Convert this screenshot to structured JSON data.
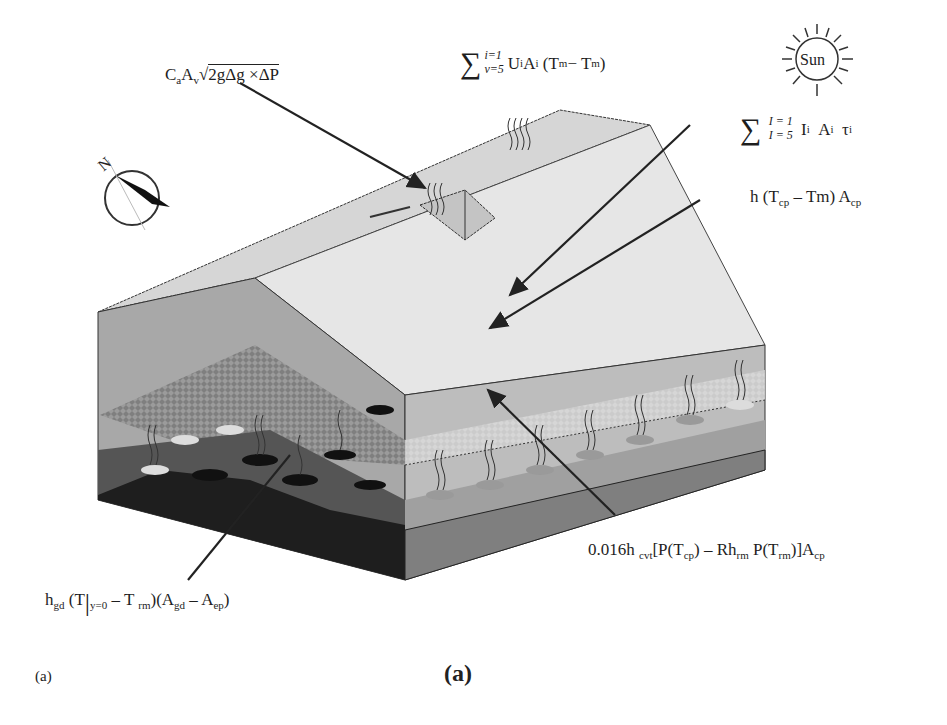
{
  "figure": {
    "caption_small": "(a)",
    "caption_large": "(a)",
    "compass_label": "N",
    "sun_label": "Sun"
  },
  "equations": {
    "ventilation": {
      "text": "C_a A_v √(2gΔg × ΔP)",
      "parts": {
        "c": "C",
        "c_sub": "a",
        "a": "A",
        "a_sub": "v",
        "radical": "2gΔg ×ΔP"
      }
    },
    "conduction_cover": {
      "text": "Σ_{v=5}^{i=1} U_i A_i (T_m − T_m)",
      "upper": "i=1",
      "lower": "v=5",
      "body": "U",
      "body_sub": "i",
      "a": "A",
      "a_sub": "i",
      "paren_open": "(T",
      "t1_sub": "m",
      "minus": " − T",
      "t2_sub": "m",
      "paren_close": ")"
    },
    "solar": {
      "text": "Σ_{I=5}^{I=1} I_i A_i τ_i",
      "upper": "I = 1",
      "lower": "I = 5",
      "i": "I",
      "i_sub": "i",
      "a": "A",
      "a_sub": "i",
      "tau": "τ",
      "tau_sub": "i"
    },
    "convection_canopy": {
      "text": "h (T_cp − Tm) A_cp",
      "h": "h  (T",
      "t_sub": "cp",
      "rest": " – Tm)  A",
      "a_sub": "cp"
    },
    "transpiration": {
      "text": "0.016h_cvt[P(T_cp) − Rh_rm P(T_rm)]A_cp",
      "p1": "0.016h ",
      "s1": "cvt",
      "p2": "[P(T",
      "s2": "cp",
      "p3": ") – Rh",
      "s3": "rm",
      "p4": " P(T",
      "s4": "rm",
      "p5": ")]A",
      "s5": "cp"
    },
    "ground": {
      "text": "h_gd (T|_{y=0} − T_rm)(A_gd − A_ep)",
      "p1": "h",
      "s1": "gd",
      "p2": " (T",
      "bar": "|",
      "s2": "y=0",
      "p3": " – T ",
      "s3": "rm",
      "p4": ")(A",
      "s4": "gd",
      "p5": " – A",
      "s5": "ep",
      "p6": ")"
    }
  },
  "colors": {
    "roof_light": "#e4e4e4",
    "roof_dark": "#cfcfcf",
    "front_wall": "#a9a9a9",
    "side_wall": "#b8b8b8",
    "canopy_mesh": "#8c8c8c",
    "floor_front": "#2a2a2a",
    "floor_side": "#9c9c9c",
    "base_side": "#7d7d7d",
    "line": "#333333"
  }
}
